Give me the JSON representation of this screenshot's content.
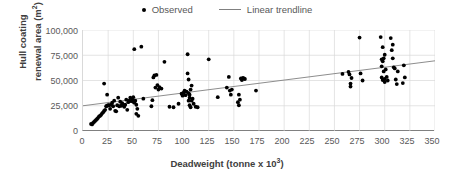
{
  "legend": {
    "position": "top-center",
    "entries": [
      {
        "label": "Observed",
        "marker": "dot-icon",
        "color": "#000000"
      },
      {
        "label": "Linear trendline",
        "marker": "line-icon",
        "color": "#808080"
      }
    ]
  },
  "axes": {
    "x_title_main": "Deadweight (tonne x 10",
    "x_title_sup": "3",
    "x_title_tail": ")",
    "x_title_full": "Deadweight (tonne x 10³)",
    "y_title_line1": "Hull coating",
    "y_title_line2_main": "renewal area (m",
    "y_title_line2_sup": "2",
    "y_title_line2_tail": ")",
    "y_title_full": "Hull coating renewal area (m²)",
    "xticks": [
      "0",
      "25",
      "50",
      "75",
      "100",
      "125",
      "150",
      "175",
      "200",
      "225",
      "250",
      "275",
      "300",
      "325",
      "350"
    ],
    "yticks": [
      "0",
      "25,000",
      "50,000",
      "75,000",
      "100,000"
    ]
  },
  "chart_data": {
    "type": "scatter",
    "title": "",
    "xlabel": "Deadweight (tonne x 10³)",
    "ylabel": "Hull coating renewal area (m²)",
    "xlim": [
      0,
      350
    ],
    "ylim": [
      0,
      100000
    ],
    "xticks": [
      0,
      25,
      50,
      75,
      100,
      125,
      150,
      175,
      200,
      225,
      250,
      275,
      300,
      325,
      350
    ],
    "yticks": [
      0,
      25000,
      50000,
      75000,
      100000
    ],
    "grid": "both",
    "legend_position": "top-center",
    "series": [
      {
        "name": "Observed",
        "type": "scatter",
        "color": "#000000",
        "marker": "circle",
        "points": [
          [
            8,
            7000
          ],
          [
            9,
            6500
          ],
          [
            10,
            8000
          ],
          [
            11,
            9000
          ],
          [
            12,
            10000
          ],
          [
            13,
            11000
          ],
          [
            14,
            12000
          ],
          [
            15,
            13000
          ],
          [
            16,
            14500
          ],
          [
            17,
            15000
          ],
          [
            18,
            16000
          ],
          [
            19,
            17500
          ],
          [
            20,
            18500
          ],
          [
            21,
            20000
          ],
          [
            21,
            47000
          ],
          [
            22,
            21000
          ],
          [
            23,
            24500
          ],
          [
            24,
            25000
          ],
          [
            24,
            36000
          ],
          [
            25,
            25500
          ],
          [
            26,
            25500
          ],
          [
            27,
            22000
          ],
          [
            28,
            26000
          ],
          [
            29,
            28000
          ],
          [
            30,
            24500
          ],
          [
            31,
            30000
          ],
          [
            32,
            20000
          ],
          [
            33,
            19500
          ],
          [
            34,
            25500
          ],
          [
            35,
            33000
          ],
          [
            36,
            24500
          ],
          [
            37,
            29000
          ],
          [
            38,
            25000
          ],
          [
            39,
            27500
          ],
          [
            40,
            25500
          ],
          [
            41,
            24000
          ],
          [
            42,
            26000
          ],
          [
            43,
            31000
          ],
          [
            44,
            21000
          ],
          [
            45,
            28500
          ],
          [
            46,
            30000
          ],
          [
            47,
            33000
          ],
          [
            48,
            29500
          ],
          [
            49,
            31000
          ],
          [
            50,
            33500
          ],
          [
            50,
            29000
          ],
          [
            51,
            28000
          ],
          [
            51,
            81000
          ],
          [
            52,
            30000
          ],
          [
            53,
            26000
          ],
          [
            53,
            17000
          ],
          [
            54,
            22000
          ],
          [
            55,
            15000
          ],
          [
            58,
            83500
          ],
          [
            60,
            32000
          ],
          [
            68,
            24500
          ],
          [
            69,
            30500
          ],
          [
            70,
            53000
          ],
          [
            71,
            55000
          ],
          [
            72,
            43000
          ],
          [
            73,
            55500
          ],
          [
            74,
            45500
          ],
          [
            75,
            41000
          ],
          [
            76,
            43500
          ],
          [
            78,
            42000
          ],
          [
            81,
            68500
          ],
          [
            86,
            24000
          ],
          [
            90,
            23500
          ],
          [
            95,
            27000
          ],
          [
            98,
            37000
          ],
          [
            99,
            35000
          ],
          [
            100,
            38000
          ],
          [
            101,
            40000
          ],
          [
            102,
            35500
          ],
          [
            103,
            39000
          ],
          [
            104,
            76000
          ],
          [
            104,
            57000
          ],
          [
            105,
            51000
          ],
          [
            105,
            37500
          ],
          [
            105,
            30000
          ],
          [
            106,
            36000
          ],
          [
            106,
            25500
          ],
          [
            106,
            33000
          ],
          [
            107,
            41000
          ],
          [
            107,
            23500
          ],
          [
            108,
            45000
          ],
          [
            108,
            30000
          ],
          [
            109,
            32000
          ],
          [
            110,
            27000
          ],
          [
            112,
            24000
          ],
          [
            114,
            23500
          ],
          [
            125,
            71000
          ],
          [
            134,
            33500
          ],
          [
            143,
            43000
          ],
          [
            145,
            53500
          ],
          [
            146,
            40000
          ],
          [
            147,
            36000
          ],
          [
            148,
            41000
          ],
          [
            154,
            28500
          ],
          [
            155,
            25500
          ],
          [
            155,
            36000
          ],
          [
            156,
            31000
          ],
          [
            157,
            52000
          ],
          [
            158,
            50500
          ],
          [
            159,
            52500
          ],
          [
            160,
            52000
          ],
          [
            161,
            51500
          ],
          [
            172,
            40000
          ],
          [
            258,
            56500
          ],
          [
            264,
            58500
          ],
          [
            265,
            56000
          ],
          [
            266,
            47000
          ],
          [
            266,
            44000
          ],
          [
            267,
            52500
          ],
          [
            275,
            92500
          ],
          [
            276,
            57000
          ],
          [
            278,
            50000
          ],
          [
            296,
            93000
          ],
          [
            297,
            71000
          ],
          [
            297,
            64000
          ],
          [
            297,
            53000
          ],
          [
            298,
            83000
          ],
          [
            298,
            69000
          ],
          [
            298,
            50500
          ],
          [
            299,
            72000
          ],
          [
            299,
            59000
          ],
          [
            300,
            75500
          ],
          [
            300,
            51500
          ],
          [
            300,
            48500
          ],
          [
            301,
            61000
          ],
          [
            302,
            53500
          ],
          [
            303,
            50000
          ],
          [
            306,
            92000
          ],
          [
            307,
            80000
          ],
          [
            308,
            85500
          ],
          [
            308,
            72000
          ],
          [
            309,
            63000
          ],
          [
            310,
            62000
          ],
          [
            311,
            51000
          ],
          [
            312,
            46500
          ],
          [
            313,
            59000
          ],
          [
            318,
            47500
          ],
          [
            319,
            65000
          ],
          [
            320,
            53000
          ]
        ]
      },
      {
        "name": "Linear trendline",
        "type": "line",
        "color": "#808080",
        "x": [
          0,
          350
        ],
        "y": [
          25000,
          69500
        ],
        "slope": 127.1,
        "intercept": 25000
      }
    ]
  }
}
